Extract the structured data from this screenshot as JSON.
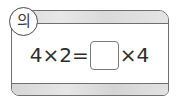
{
  "badge": {
    "label": "의"
  },
  "equation": {
    "left_operand_a": "4",
    "operator_1": "×",
    "left_operand_b": "2",
    "equals": "=",
    "blank_value": "",
    "operator_2": "×",
    "right_operand": "4"
  },
  "colors": {
    "border": "#6f6f6f",
    "band": "#dedede",
    "text": "#2e2e2e"
  }
}
